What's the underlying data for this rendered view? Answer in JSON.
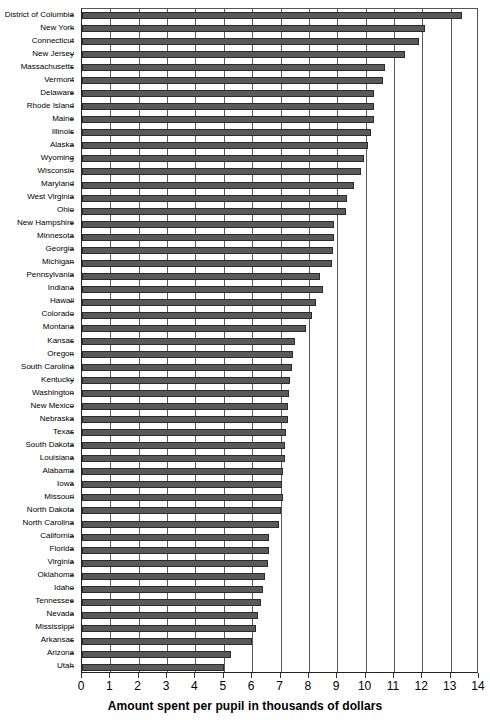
{
  "chart_data": {
    "type": "bar",
    "orientation": "horizontal",
    "title": "",
    "subtitle": "",
    "xlabel": "Amount spent per pupil in thousands of dollars",
    "ylabel": "",
    "xlim": [
      0,
      14
    ],
    "ylim": null,
    "xticks": [
      0,
      1,
      2,
      3,
      4,
      5,
      6,
      7,
      8,
      9,
      10,
      11,
      12,
      13,
      14
    ],
    "grid": "vertical-major",
    "legend": null,
    "bar_color": "#595959",
    "bar_edge_color": "#2b2b2b",
    "background_color": "#ffffff",
    "sorted": "descending",
    "categories": [
      "District of Columbia",
      "New York",
      "Connecticut",
      "New Jersey",
      "Massachusetts",
      "Vermont",
      "Delaware",
      "Rhode Island",
      "Maine",
      "Illinois",
      "Alaska",
      "Wyoming",
      "Wisconsin",
      "Maryland",
      "West Virginia",
      "Ohio",
      "New Hampshire",
      "Minnesota",
      "Georgia",
      "Michigan",
      "Pennsylvania",
      "Indiana",
      "Hawaii",
      "Colorado",
      "Montana",
      "Kansas",
      "Oregon",
      "South Carolina",
      "Kentucky",
      "Washington",
      "New Mexico",
      "Nebraska",
      "Texas",
      "South Dakota",
      "Louisiana",
      "Alabama",
      "Iowa",
      "Missouri",
      "North Dakota",
      "North Carolina",
      "California",
      "Florida",
      "Virginia",
      "Oklahoma",
      "Idaho",
      "Tennessee",
      "Nevada",
      "Mississippi",
      "Arkansas",
      "Arizona",
      "Utah"
    ],
    "values": [
      13.4,
      12.1,
      11.9,
      11.4,
      10.7,
      10.6,
      10.3,
      10.3,
      10.3,
      10.2,
      10.1,
      9.95,
      9.85,
      9.6,
      9.35,
      9.3,
      8.9,
      8.9,
      8.85,
      8.8,
      8.4,
      8.5,
      8.25,
      8.1,
      7.9,
      7.5,
      7.45,
      7.4,
      7.35,
      7.3,
      7.25,
      7.25,
      7.2,
      7.15,
      7.15,
      7.1,
      7.05,
      7.1,
      7.0,
      6.95,
      6.6,
      6.6,
      6.55,
      6.45,
      6.4,
      6.3,
      6.2,
      6.15,
      6.0,
      5.25,
      5.0
    ]
  }
}
